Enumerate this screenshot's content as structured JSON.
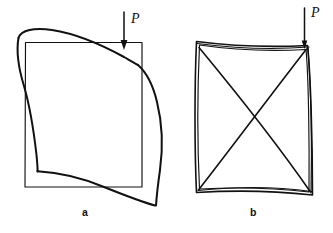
{
  "figure": {
    "type": "line-diagram",
    "background_color": "#ffffff",
    "ink_color": "#111111"
  },
  "panels": [
    {
      "id": "a",
      "label": "a",
      "load_label": "P",
      "load_direction": "down",
      "undeformed_shape": "square",
      "deformed_shape": "s-curve buckle",
      "square": {
        "left": 25,
        "top": 42,
        "right": 142,
        "bottom": 187
      },
      "arrow": {
        "x": 124,
        "y_start": 12,
        "y_end": 48
      }
    },
    {
      "id": "b",
      "label": "b",
      "load_label": "P",
      "load_direction": "down",
      "undeformed_shape": "square",
      "deformed_shape": "square with diagonals",
      "square": {
        "left": 196,
        "top": 41,
        "right": 310,
        "bottom": 194
      },
      "arrow": {
        "x": 304,
        "y_start": 8,
        "y_end": 45
      },
      "diagonals": 2
    }
  ]
}
